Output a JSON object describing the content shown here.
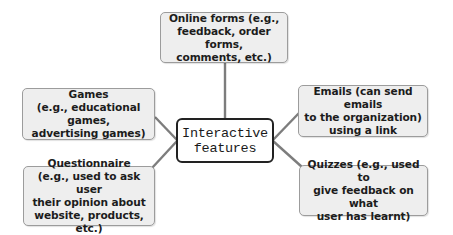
{
  "diagram": {
    "type": "mind-map",
    "center": {
      "label": "Interactive\nfeatures"
    },
    "nodes": [
      {
        "id": "online-forms",
        "position": "top",
        "label": "Online forms (e.g.,\nfeedback, order forms,\ncomments, etc.)"
      },
      {
        "id": "games",
        "position": "left-upper",
        "label": "Games\n(e.g., educational games,\nadvertising games)"
      },
      {
        "id": "questionnaire",
        "position": "left-lower",
        "label": "Questionnaire\n(e.g., used to ask user\ntheir opinion about\nwebsite, products, etc.)"
      },
      {
        "id": "emails",
        "position": "right-upper",
        "label": "Emails (can send emails\nto the organization)\nusing a link"
      },
      {
        "id": "quizzes",
        "position": "right-lower",
        "label": "Quizzes (e.g., used to\ngive feedback on what\nuser has learnt)"
      }
    ],
    "colors": {
      "node_fill": "#eeeeee",
      "node_border": "#9c9c9c",
      "center_fill": "#ffffff",
      "center_border": "#222222",
      "connector": "#7d7d7d",
      "text": "#1c1c1c"
    }
  }
}
